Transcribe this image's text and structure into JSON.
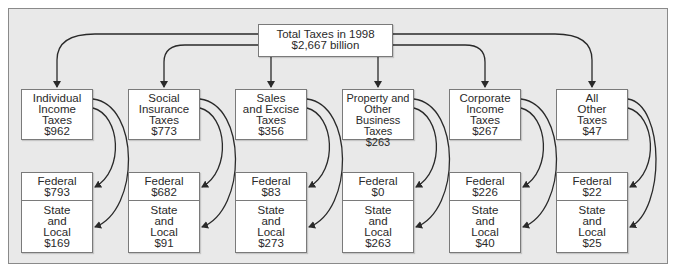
{
  "title": {
    "lines": [
      "Total Taxes in 1998",
      "$2,667 billion"
    ]
  },
  "categories": [
    {
      "label_lines": [
        "Individual",
        "Income",
        "Taxes",
        "$962"
      ],
      "federal_lines": [
        "Federal",
        "$793"
      ],
      "state_local_lines": [
        "State",
        "and",
        "Local",
        "$169"
      ]
    },
    {
      "label_lines": [
        "Social",
        "Insurance",
        "Taxes",
        "$773"
      ],
      "federal_lines": [
        "Federal",
        "$682"
      ],
      "state_local_lines": [
        "State",
        "and",
        "Local",
        "$91"
      ]
    },
    {
      "label_lines": [
        "Sales",
        "and Excise",
        "Taxes",
        "$356"
      ],
      "federal_lines": [
        "Federal",
        "$83"
      ],
      "state_local_lines": [
        "State",
        "and",
        "Local",
        "$273"
      ]
    },
    {
      "label_lines": [
        "Property and",
        "Other Business",
        "Taxes",
        "$263"
      ],
      "federal_lines": [
        "Federal",
        "$0"
      ],
      "state_local_lines": [
        "State",
        "and",
        "Local",
        "$263"
      ]
    },
    {
      "label_lines": [
        "Corporate",
        "Income",
        "Taxes",
        "$267"
      ],
      "federal_lines": [
        "Federal",
        "$226"
      ],
      "state_local_lines": [
        "State",
        "and",
        "Local",
        "$40"
      ]
    },
    {
      "label_lines": [
        "All",
        "Other",
        "Taxes",
        "$47"
      ],
      "federal_lines": [
        "Federal",
        "$22"
      ],
      "state_local_lines": [
        "State",
        "and",
        "Local",
        "$25"
      ]
    }
  ],
  "colors": {
    "background": "#e9e9e9",
    "box_fill": "#ffffff",
    "stroke": "#2a2a2a"
  }
}
